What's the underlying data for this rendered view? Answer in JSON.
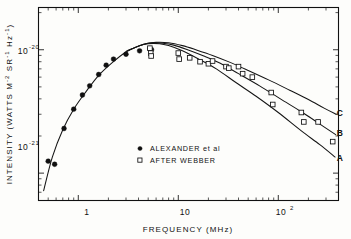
{
  "chart_data": {
    "type": "line",
    "title": "",
    "xlabel": "FREQUENCY   (MHz)",
    "ylabel": "INTENSITY  (WATTS  M⁻² SR⁻¹ Hz⁻¹)",
    "xscale": "log",
    "yscale": "log",
    "xlim": [
      0.4,
      400
    ],
    "ylim": [
      6e-22,
      2.2e-20
    ],
    "grid": false,
    "legend_position": "inside-bottom-center",
    "xticks": [
      {
        "value": 1,
        "label": "1"
      },
      {
        "value": 10,
        "label": "10"
      },
      {
        "value": 100,
        "label": "10",
        "exponent": "2"
      }
    ],
    "yticks": [
      {
        "value": 1e-20,
        "label": "10",
        "exponent": "-20"
      },
      {
        "value": 1e-21,
        "label": "10",
        "exponent": "-21"
      }
    ],
    "series": [
      {
        "name": "ALEXANDER et al",
        "marker": "filled-circle",
        "marker_label": "●",
        "points": [
          {
            "x": 0.5,
            "y": 1.25e-21
          },
          {
            "x": 0.58,
            "y": 1.18e-21
          },
          {
            "x": 0.72,
            "y": 2.3e-21
          },
          {
            "x": 0.9,
            "y": 3.3e-21
          },
          {
            "x": 1.1,
            "y": 4.3e-21
          },
          {
            "x": 1.3,
            "y": 5.1e-21
          },
          {
            "x": 1.6,
            "y": 6.3e-21
          },
          {
            "x": 1.9,
            "y": 7.5e-21
          },
          {
            "x": 2.25,
            "y": 8.4e-21
          },
          {
            "x": 3.0,
            "y": 9.2e-21
          },
          {
            "x": 4.1,
            "y": 9.8e-21
          },
          {
            "x": 5.2,
            "y": 1.02e-20
          },
          {
            "x": 5.4,
            "y": 1e-20
          }
        ]
      },
      {
        "name": "AFTER WEBBER",
        "marker": "open-square",
        "marker_label": "□",
        "points": [
          {
            "x": 5.2,
            "y": 1.03e-20
          },
          {
            "x": 5.3,
            "y": 9.4e-21
          },
          {
            "x": 5.35,
            "y": 8.9e-21
          },
          {
            "x": 10.0,
            "y": 9.4e-21
          },
          {
            "x": 10.2,
            "y": 8.4e-21
          },
          {
            "x": 13.0,
            "y": 8.6e-21
          },
          {
            "x": 16.5,
            "y": 8e-21
          },
          {
            "x": 20.0,
            "y": 7.7e-21
          },
          {
            "x": 22.0,
            "y": 8.1e-21
          },
          {
            "x": 30.0,
            "y": 7.3e-21
          },
          {
            "x": 32.0,
            "y": 7.1e-21
          },
          {
            "x": 40.0,
            "y": 7.3e-21
          },
          {
            "x": 44.0,
            "y": 6.4e-21
          },
          {
            "x": 55.0,
            "y": 6e-21
          },
          {
            "x": 85.0,
            "y": 4.5e-21
          },
          {
            "x": 88.0,
            "y": 3.6e-21
          },
          {
            "x": 170.0,
            "y": 3.1e-21
          },
          {
            "x": 180.0,
            "y": 2.6e-21
          },
          {
            "x": 250.0,
            "y": 2.6e-21
          },
          {
            "x": 350.0,
            "y": 1.8e-21
          }
        ]
      }
    ],
    "model_curves": [
      {
        "name": "A",
        "label": "A",
        "points": [
          {
            "x": 0.45,
            "y": 7.2e-22
          },
          {
            "x": 0.55,
            "y": 1.35e-21
          },
          {
            "x": 0.7,
            "y": 2.25e-21
          },
          {
            "x": 0.9,
            "y": 3.3e-21
          },
          {
            "x": 1.2,
            "y": 4.6e-21
          },
          {
            "x": 1.6,
            "y": 6.2e-21
          },
          {
            "x": 2.2,
            "y": 7.9e-21
          },
          {
            "x": 3.0,
            "y": 9.6e-21
          },
          {
            "x": 4.0,
            "y": 1.07e-20
          },
          {
            "x": 5.0,
            "y": 1.12e-20
          },
          {
            "x": 6.5,
            "y": 1.12e-20
          },
          {
            "x": 8.0,
            "y": 1.08e-20
          },
          {
            "x": 11.0,
            "y": 9.8e-21
          },
          {
            "x": 16.0,
            "y": 8.4e-21
          },
          {
            "x": 24.0,
            "y": 7e-21
          },
          {
            "x": 38.0,
            "y": 5.4e-21
          },
          {
            "x": 60.0,
            "y": 4.2e-21
          },
          {
            "x": 100.0,
            "y": 3.1e-21
          },
          {
            "x": 170.0,
            "y": 2.2e-21
          },
          {
            "x": 260.0,
            "y": 1.7e-21
          },
          {
            "x": 370.0,
            "y": 1.35e-21
          }
        ]
      },
      {
        "name": "B",
        "label": "B",
        "points": [
          {
            "x": 3.0,
            "y": 9.7e-21
          },
          {
            "x": 4.2,
            "y": 1.09e-20
          },
          {
            "x": 5.5,
            "y": 1.14e-20
          },
          {
            "x": 7.0,
            "y": 1.13e-20
          },
          {
            "x": 9.0,
            "y": 1.09e-20
          },
          {
            "x": 12.0,
            "y": 1.01e-20
          },
          {
            "x": 18.0,
            "y": 8.9e-21
          },
          {
            "x": 26.0,
            "y": 7.8e-21
          },
          {
            "x": 40.0,
            "y": 6.4e-21
          },
          {
            "x": 65.0,
            "y": 5.1e-21
          },
          {
            "x": 105.0,
            "y": 4e-21
          },
          {
            "x": 175.0,
            "y": 3.1e-21
          },
          {
            "x": 270.0,
            "y": 2.45e-21
          },
          {
            "x": 375.0,
            "y": 2.05e-21
          }
        ]
      },
      {
        "name": "C",
        "label": "C",
        "points": [
          {
            "x": 3.2,
            "y": 9.9e-21
          },
          {
            "x": 4.5,
            "y": 1.11e-20
          },
          {
            "x": 6.0,
            "y": 1.15e-20
          },
          {
            "x": 8.0,
            "y": 1.14e-20
          },
          {
            "x": 11.0,
            "y": 1.08e-20
          },
          {
            "x": 15.0,
            "y": 1e-20
          },
          {
            "x": 22.0,
            "y": 9e-21
          },
          {
            "x": 33.0,
            "y": 7.9e-21
          },
          {
            "x": 50.0,
            "y": 6.8e-21
          },
          {
            "x": 80.0,
            "y": 5.7e-21
          },
          {
            "x": 130.0,
            "y": 4.7e-21
          },
          {
            "x": 200.0,
            "y": 3.95e-21
          },
          {
            "x": 290.0,
            "y": 3.35e-21
          },
          {
            "x": 380.0,
            "y": 3e-21
          }
        ]
      }
    ],
    "annotations": [
      {
        "text": "C",
        "x": 385,
        "y": 3.05e-21
      },
      {
        "text": "B",
        "x": 385,
        "y": 2.1e-21
      },
      {
        "text": "A",
        "x": 385,
        "y": 1.32e-21
      }
    ]
  },
  "legend": {
    "entries": [
      {
        "marker": "filled-circle",
        "label": "ALEXANDER et al"
      },
      {
        "marker": "open-square",
        "label": "AFTER WEBBER"
      }
    ]
  },
  "axes": {
    "x_title": "FREQUENCY   (MHz)",
    "y_title_part1": "INTENSITY  (WATTS  M",
    "y_title_sup1": "-2",
    "y_title_part2": " SR",
    "y_title_sup2": "-1",
    "y_title_part3": " Hz",
    "y_title_sup3": "-1",
    "y_title_part4": ")",
    "x_tick_1": "1",
    "x_tick_10": "10",
    "x_tick_100_base": "10",
    "x_tick_100_exp": "2",
    "y_tick_20_base": "10",
    "y_tick_20_exp": "-20",
    "y_tick_21_base": "10",
    "y_tick_21_exp": "-21"
  },
  "colors": {
    "ink": "#111111",
    "paper": "#fdfdfb",
    "marker_fill": "#101010"
  }
}
